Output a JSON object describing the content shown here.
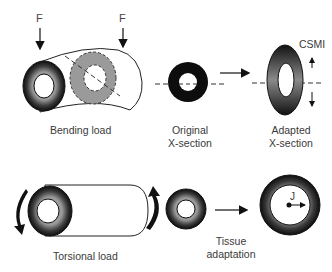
{
  "diagram": {
    "bending": {
      "force_label_left": "F",
      "force_label_right": "F",
      "caption": "Bending load"
    },
    "original": {
      "caption_line1": "Original",
      "caption_line2": "X-section"
    },
    "adapted": {
      "caption_line1": "Adapted",
      "caption_line2": "X-section",
      "axis_label": "CSMI"
    },
    "torsion": {
      "caption": "Torsional load"
    },
    "tissue": {
      "caption_line1": "Tissue",
      "caption_line2": "adaptation"
    },
    "polar": {
      "label": "J"
    },
    "colors": {
      "bone_dark": "#111111",
      "bone_mid": "#6a6a6a",
      "section_gray": "#9a9a9a",
      "line": "#222222"
    }
  }
}
